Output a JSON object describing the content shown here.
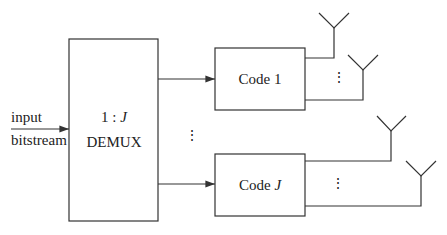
{
  "diagram": {
    "input_label_line1": "input",
    "input_label_line2": "bitstream",
    "demux": {
      "ratio_prefix": "1 : ",
      "ratio_var": "J",
      "name": "DEMUX"
    },
    "encoders": [
      {
        "label_prefix": "Code ",
        "label_var": "1"
      },
      {
        "label_prefix": "Code ",
        "label_var": "J"
      }
    ],
    "ellipsis": "⋮",
    "colors": {
      "stroke": "#333333",
      "background": "#ffffff"
    }
  }
}
